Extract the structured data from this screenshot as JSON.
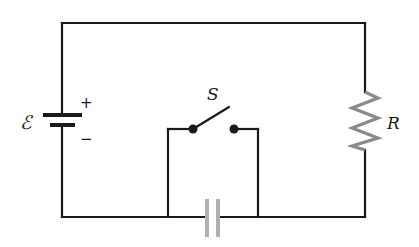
{
  "diagram": {
    "title": "",
    "type": "circuit",
    "colors": {
      "wire": "#1a1a1a",
      "resistor": "#8a8a8a",
      "capacitor": "#b0b0b0",
      "background": "#ffffff"
    },
    "components": {
      "battery": {
        "label": "ℰ",
        "plus": "+",
        "minus": "−"
      },
      "switch": {
        "label": "S",
        "state": "open"
      },
      "resistor": {
        "label": "R"
      },
      "capacitor": {
        "label": ""
      }
    }
  }
}
